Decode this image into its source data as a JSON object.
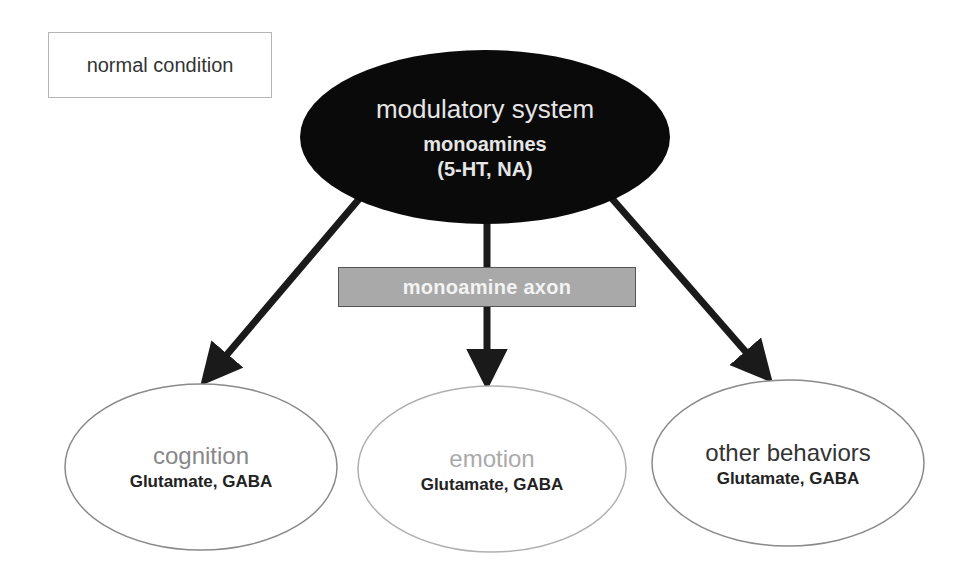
{
  "diagram": {
    "condition_label": "normal condition",
    "source": {
      "title": "modulatory system",
      "subtitle": "monoamines",
      "detail": "(5-HT, NA)",
      "fill": "#0a0a0a",
      "text_color": "#e6e6e6"
    },
    "pathway": {
      "label": "monoamine axon",
      "fill": "#a9a9a9"
    },
    "targets": [
      {
        "title": "cognition",
        "detail": "Glutamate, GABA",
        "title_color": "#888888"
      },
      {
        "title": "emotion",
        "detail": "Glutamate, GABA",
        "title_color": "#aaaaaa"
      },
      {
        "title": "other behaviors",
        "detail": "Glutamate, GABA",
        "title_color": "#333333"
      }
    ],
    "edges": [
      {
        "from": "modulatory system",
        "to": "cognition"
      },
      {
        "from": "modulatory system",
        "to": "emotion"
      },
      {
        "from": "modulatory system",
        "to": "other behaviors"
      }
    ]
  }
}
